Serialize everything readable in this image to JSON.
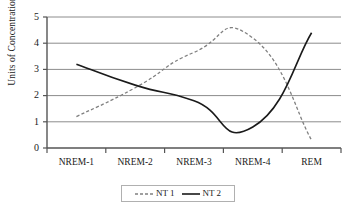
{
  "chart_data": {
    "type": "line",
    "title": "",
    "subtitle": "",
    "xlabel": "",
    "ylabel": "Units of Concentration",
    "categories": [
      "NREM-1",
      "NREM-2",
      "NREM-3",
      "NREM-4",
      "REM"
    ],
    "ylim": [
      0,
      5
    ],
    "yticks": [
      0,
      1,
      2,
      3,
      4,
      5
    ],
    "ytick_labels": [
      "0",
      "1",
      "2",
      "3",
      "4",
      "5"
    ],
    "grid": "horizontal",
    "legend_position": "bottom-center",
    "smoothed": true,
    "series": [
      {
        "name": "NT 1",
        "values": [
          1.2,
          2.3,
          3.65,
          4.2,
          0.3
        ],
        "style": "dashed",
        "color": "#808080"
      },
      {
        "name": "NT 2",
        "values": [
          3.2,
          2.4,
          1.8,
          0.8,
          4.4
        ],
        "style": "solid",
        "color": "#1a1a1a"
      }
    ]
  },
  "legend": {
    "items": [
      {
        "label": "NT 1",
        "style": "dashed",
        "color": "#808080"
      },
      {
        "label": "NT 2",
        "style": "solid",
        "color": "#1a1a1a"
      }
    ]
  },
  "colors": {
    "background": "#ffffff",
    "axis": "#555555",
    "gridline": "#8c8c8c",
    "text": "#1a1a1a",
    "legend_border": "#b0b0b0",
    "series_nt1": "#808080",
    "series_nt2": "#1a1a1a"
  }
}
